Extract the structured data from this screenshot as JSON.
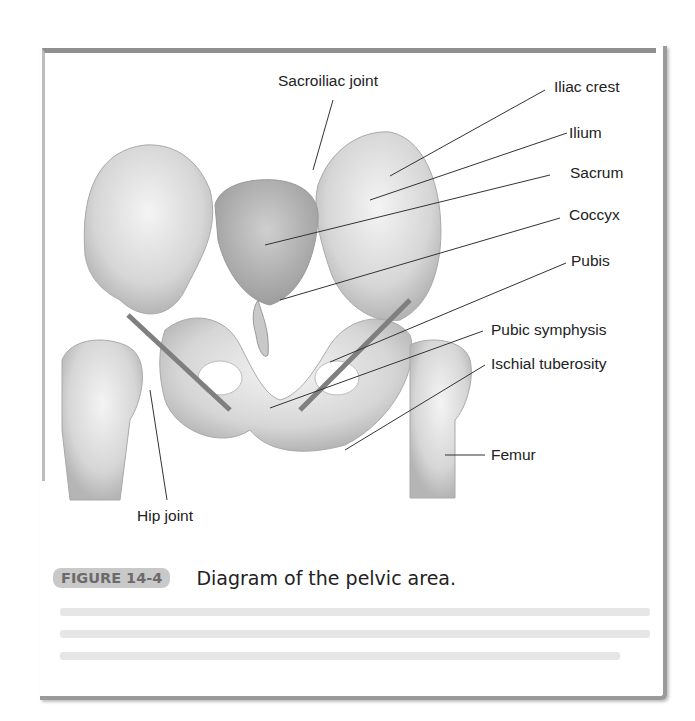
{
  "figure": {
    "badge": "FIGURE 14-4",
    "caption": "Diagram of the pelvic area."
  },
  "labels": {
    "sacroiliac_joint": "Sacroiliac joint",
    "iliac_crest": "Iliac crest",
    "ilium": "Ilium",
    "sacrum": "Sacrum",
    "coccyx": "Coccyx",
    "pubis": "Pubis",
    "pubic_symphysis": "Pubic symphysis",
    "ischial_tuberosity": "Ischial tuberosity",
    "femur": "Femur",
    "hip_joint": "Hip joint"
  }
}
